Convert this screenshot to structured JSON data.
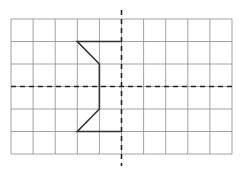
{
  "diagram": {
    "type": "grid-figure-reflection",
    "grid": {
      "cols": 10,
      "rows": 6,
      "left": 11,
      "top": 19,
      "right": 232,
      "bottom": 154,
      "line_color": "#8a8a8a"
    },
    "axes": {
      "vertical_x_col": 5,
      "horizontal_y_row": 3,
      "vertical_extent": [
        10,
        166
      ],
      "horizontal_extent": [
        11,
        232
      ],
      "color": "#222222",
      "style": "dashed"
    },
    "shape": {
      "color": "#333333",
      "points_grid": [
        [
          5,
          1
        ],
        [
          3,
          1
        ],
        [
          4,
          2
        ],
        [
          4,
          4
        ],
        [
          3,
          5
        ],
        [
          5,
          5
        ]
      ]
    }
  }
}
